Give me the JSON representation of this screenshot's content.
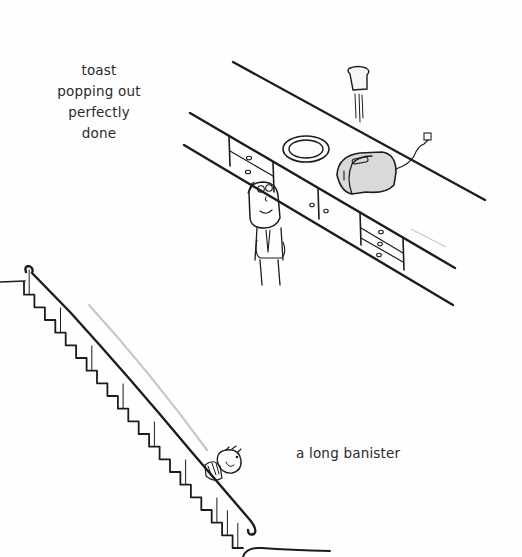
{
  "illustrations": [
    {
      "id": "toast",
      "caption_lines": [
        "toast",
        "popping out",
        "perfectly",
        "done"
      ],
      "elements": [
        "countertop",
        "cabinets",
        "plate",
        "toaster",
        "flying-toast",
        "wall-outlet",
        "person-looking-up"
      ]
    },
    {
      "id": "banister",
      "caption_lines": [
        "a long banister"
      ],
      "elements": [
        "staircase",
        "handrail",
        "person-sliding-down"
      ]
    }
  ],
  "colors": {
    "ink": "#1c1c1c",
    "background": "#fefefe",
    "toaster_fill": "#d9d9d9",
    "motion_line": "#c8c8c8"
  }
}
